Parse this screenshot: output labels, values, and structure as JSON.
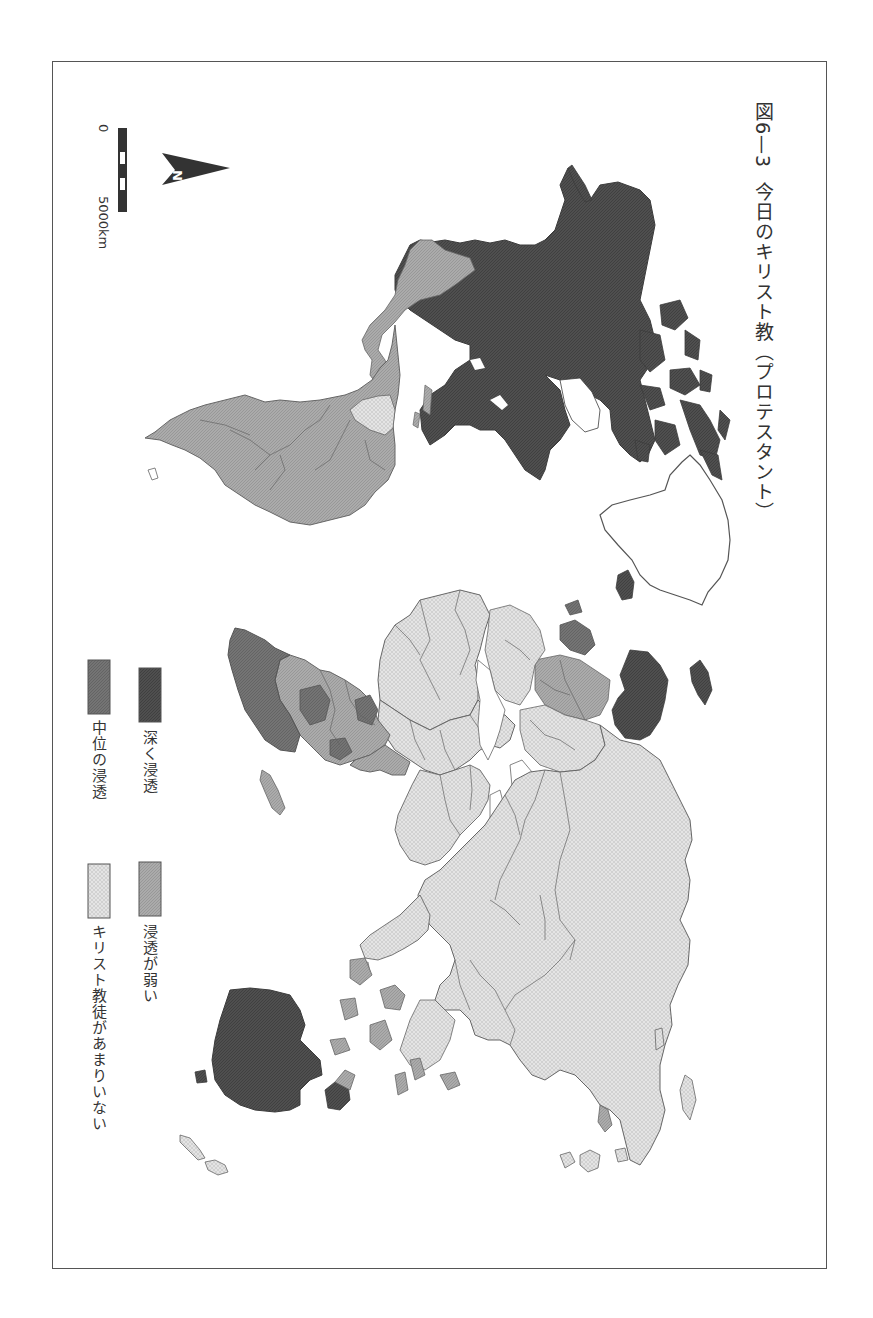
{
  "figure": {
    "number": "図6—3",
    "title": "今日のキリスト教（プロテスタント）",
    "orientation": "rotated 90° clockwise (north points right)"
  },
  "legend": {
    "items": [
      {
        "key": "deep",
        "label": "深く浸透",
        "color": "#4d4d4d"
      },
      {
        "key": "weak",
        "label": "浸透が弱い",
        "color": "#a9a9a9"
      },
      {
        "key": "medium",
        "label": "中位の浸透",
        "color": "#6e6e6e"
      },
      {
        "key": "few",
        "label": "キリスト教徒があまりいない",
        "color": "#e2e2e2"
      }
    ]
  },
  "north_arrow": {
    "label": "N"
  },
  "scale_bar": {
    "start_label": "0",
    "end_label": "5000km"
  },
  "map_regions": [
    {
      "region": "North America (USA/Canada)",
      "category": "deep"
    },
    {
      "region": "Greenland",
      "category": "none"
    },
    {
      "region": "Mexico / Central America",
      "category": "weak"
    },
    {
      "region": "South America",
      "category": "weak"
    },
    {
      "region": "Guianas",
      "category": "few"
    },
    {
      "region": "Iceland",
      "category": "deep"
    },
    {
      "region": "Scandinavia",
      "category": "deep"
    },
    {
      "region": "Western/Central Europe",
      "category": "medium"
    },
    {
      "region": "Southern Europe",
      "category": "few"
    },
    {
      "region": "Svalbard",
      "category": "deep"
    },
    {
      "region": "Sub-Saharan Africa (south/east)",
      "category": "medium"
    },
    {
      "region": "Central Africa",
      "category": "weak"
    },
    {
      "region": "North Africa",
      "category": "few"
    },
    {
      "region": "Madagascar",
      "category": "weak"
    },
    {
      "region": "Middle East",
      "category": "few"
    },
    {
      "region": "Russia / Central Asia",
      "category": "few"
    },
    {
      "region": "South Asia",
      "category": "few"
    },
    {
      "region": "China / East Asia",
      "category": "few"
    },
    {
      "region": "Korea",
      "category": "weak"
    },
    {
      "region": "Japan",
      "category": "few"
    },
    {
      "region": "Southeast Asia",
      "category": "few"
    },
    {
      "region": "Indonesia / Philippines",
      "category": "weak"
    },
    {
      "region": "Papua New Guinea",
      "category": "deep"
    },
    {
      "region": "Australia",
      "category": "deep"
    },
    {
      "region": "New Zealand",
      "category": "few"
    }
  ]
}
